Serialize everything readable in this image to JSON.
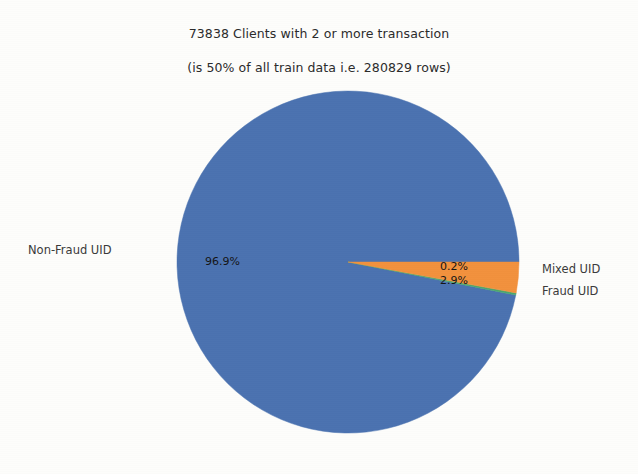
{
  "chart_data": {
    "type": "pie",
    "title": "73838 Clients with 2 or more transaction\n(is 50% of all train data i.e. 280829 rows)",
    "title_line1": "73838 Clients with 2 or more transaction",
    "title_line2": "(is 50% of all train data i.e. 280829 rows)",
    "xlabel": "",
    "ylabel": "",
    "grid": false,
    "legend_position": "outside-labels",
    "total_clients": 73838,
    "total_rows": 280829,
    "percent_of_train_data": "50%",
    "categories": [
      "Non-Fraud UID",
      "Mixed UID",
      "Fraud UID"
    ],
    "values": [
      96.9,
      0.2,
      2.9
    ],
    "labels": [
      "96.9%",
      "0.2%",
      "2.9%"
    ],
    "colors": [
      "#4b72b0",
      "#4aa86f",
      "#f2913d"
    ],
    "start_angle_deg": 0,
    "direction": "counterclockwise",
    "slices": [
      {
        "name": "Non-Fraud UID",
        "percent": 96.9,
        "label": "96.9%",
        "color": "#4b72b0"
      },
      {
        "name": "Mixed UID",
        "percent": 0.2,
        "label": "0.2%",
        "color": "#4aa86f"
      },
      {
        "name": "Fraud UID",
        "percent": 2.9,
        "label": "2.9%",
        "color": "#f2913d"
      }
    ]
  },
  "pie": {
    "center_x": 348,
    "center_y": 262,
    "radius": 171,
    "labels": {
      "nonfraud": "Non-Fraud UID",
      "mixed": "Mixed UID",
      "fraud": "Fraud UID"
    },
    "percents": {
      "nonfraud": "96.9%",
      "mixed": "0.2%",
      "fraud": "2.9%"
    }
  },
  "colors": {
    "nonfraud": "#4b72b0",
    "mixed": "#4aa86f",
    "fraud": "#f2913d",
    "background": "#fdfdfb",
    "text": "#2b2b2b"
  }
}
